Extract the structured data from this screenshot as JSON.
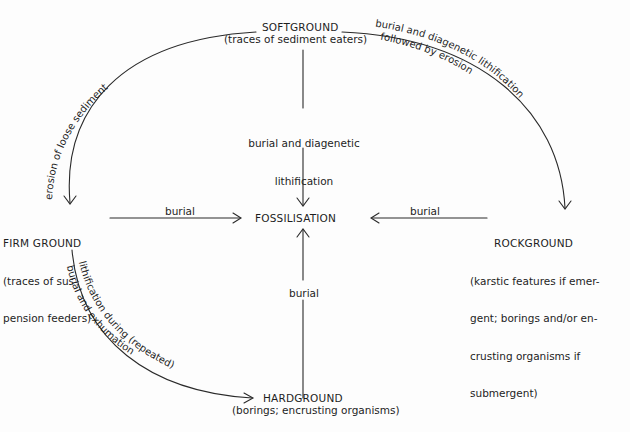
{
  "diagram": {
    "nodes": {
      "softground": {
        "title": "SOFTGROUND",
        "subtitle": "(traces of sediment eaters)"
      },
      "firmground": {
        "title": "FIRM GROUND",
        "subtitle_lines": [
          "(traces of sus-",
          "pension feeders)"
        ]
      },
      "fossilisation": {
        "title": "FOSSILISATION"
      },
      "rockground": {
        "title": "ROCKGROUND",
        "subtitle_lines": [
          "(karstic features if emer-",
          "gent; borings and/or en-",
          "crusting organisms if",
          "submergent)"
        ]
      },
      "hardground": {
        "title": "HARDGROUND",
        "subtitle": "(borings; encrusting organisms)"
      }
    },
    "edges": {
      "soft_to_firm": {
        "label": "erosion of loose sediment"
      },
      "soft_to_fossil": {
        "label_lines": [
          "burial and diagenetic",
          "lithification"
        ]
      },
      "soft_to_rock": {
        "label_line1": "burial and diagenetic lithification",
        "label_line2": "followed by erosion"
      },
      "firm_to_fossil": {
        "label": "burial"
      },
      "rock_to_fossil": {
        "label": "burial"
      },
      "hard_to_fossil": {
        "label": "burial"
      },
      "firm_to_hard": {
        "label_line1": "lithification during (repeated)",
        "label_line2": "burial and exhumation"
      }
    },
    "line_color": "#2a2a2a"
  }
}
